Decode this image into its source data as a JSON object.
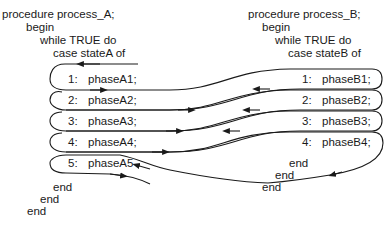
{
  "process_a": {
    "header": [
      "procedure process_A;",
      "begin",
      "while TRUE do",
      "case stateA of"
    ],
    "cases": [
      {
        "label": "1:",
        "phase": "phaseA1;"
      },
      {
        "label": "2:",
        "phase": "phaseA2;"
      },
      {
        "label": "3:",
        "phase": "phaseA3;"
      },
      {
        "label": "4:",
        "phase": "phaseA4;"
      },
      {
        "label": "5:",
        "phase": "phaseA5"
      }
    ],
    "footer": [
      "end",
      "end",
      "end"
    ]
  },
  "process_b": {
    "header": [
      "procedure process_B;",
      "begin",
      "while TRUE do",
      "case stateB of"
    ],
    "cases": [
      {
        "label": "1:",
        "phase": "phaseB1;"
      },
      {
        "label": "2:",
        "phase": "phaseB2;"
      },
      {
        "label": "3:",
        "phase": "phaseB3;"
      },
      {
        "label": "4:",
        "phase": "phaseB4;"
      }
    ],
    "footer": [
      "end",
      "end",
      "end"
    ]
  },
  "colors": {
    "ink": "#1a1a1a",
    "background": "#ffffff"
  }
}
